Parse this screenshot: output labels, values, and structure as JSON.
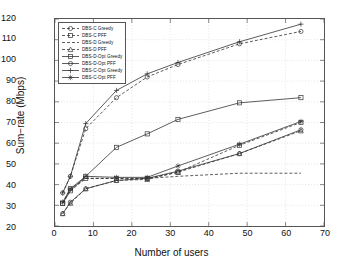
{
  "chart_data": {
    "type": "line",
    "title": "",
    "xlabel": "Number of users",
    "ylabel": "Sum−rate (Mbps)",
    "xlim": [
      0,
      70
    ],
    "ylim": [
      20,
      120
    ],
    "xticks": [
      0,
      10,
      20,
      30,
      40,
      50,
      60,
      70
    ],
    "yticks": [
      20,
      30,
      40,
      50,
      60,
      70,
      80,
      90,
      100,
      110,
      120
    ],
    "grid": true,
    "legend_position": "top-left",
    "x": [
      2,
      4,
      8,
      16,
      24,
      32,
      48,
      64
    ],
    "series": [
      {
        "name": "DBS-C Greedy",
        "line": "dashed",
        "marker": "circle",
        "color": "#333333",
        "values": [
          36,
          44,
          67,
          82,
          92,
          98,
          108,
          114
        ]
      },
      {
        "name": "DBS-C PFF",
        "line": "dashed",
        "marker": "square",
        "color": "#333333",
        "values": [
          31,
          38,
          43,
          43,
          43,
          46,
          59,
          70
        ]
      },
      {
        "name": "DBS-D Greedy",
        "line": "dashed",
        "marker": "none",
        "color": "#333333",
        "values": [
          31,
          37,
          43,
          43,
          43,
          44,
          45.5,
          45.5
        ]
      },
      {
        "name": "DBS-D PFF",
        "line": "dashed",
        "marker": "triangle",
        "color": "#333333",
        "values": [
          26,
          31,
          38,
          42,
          42.5,
          46,
          55,
          66
        ]
      },
      {
        "name": "DBS-D-Opt Greedy",
        "line": "solid",
        "marker": "square",
        "color": "#333333",
        "values": [
          31,
          37,
          44,
          58,
          64.5,
          71.5,
          79.5,
          82
        ]
      },
      {
        "name": "DBS-D-Opt PFF",
        "line": "solid",
        "marker": "circle",
        "color": "#333333",
        "values": [
          26,
          31.5,
          38,
          42,
          43,
          46.5,
          55,
          66.5
        ]
      },
      {
        "name": "DBS-C-Opt Greedy",
        "line": "solid",
        "marker": "plus",
        "color": "#333333",
        "values": [
          36,
          44,
          69.5,
          85.5,
          93.5,
          99,
          109,
          117.5
        ]
      },
      {
        "name": "DBS-C-Opt PFF",
        "line": "solid",
        "marker": "star",
        "color": "#333333",
        "values": [
          31.5,
          38,
          44,
          43.5,
          43.5,
          49,
          59.5,
          70.5
        ]
      }
    ]
  }
}
